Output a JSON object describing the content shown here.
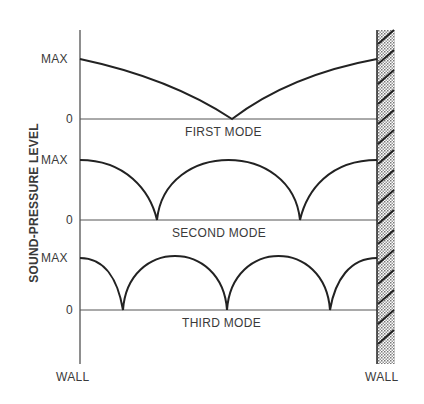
{
  "diagram": {
    "y_axis_label": "SOUND-PRESSURE LEVEL",
    "left_wall_label": "WALL",
    "right_wall_label": "WALL",
    "modes": [
      {
        "name": "FIRST MODE",
        "max_label": "MAX",
        "zero_label": "0",
        "nulls": 1
      },
      {
        "name": "SECOND MODE",
        "max_label": "MAX",
        "zero_label": "0",
        "nulls": 2
      },
      {
        "name": "THIRD MODE",
        "max_label": "MAX",
        "zero_label": "0",
        "nulls": 3
      }
    ]
  }
}
